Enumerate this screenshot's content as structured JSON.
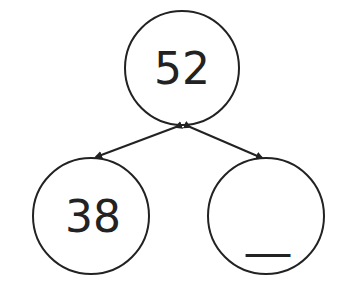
{
  "diagram": {
    "type": "number-bond",
    "whole": {
      "label": "52"
    },
    "parts": [
      {
        "label": "38"
      },
      {
        "label": "__"
      }
    ],
    "colors": {
      "stroke": "#222222",
      "background": "#ffffff"
    }
  }
}
